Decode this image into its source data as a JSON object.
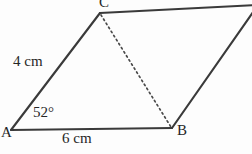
{
  "figure": {
    "kind": "parallelogram-with-diagonal",
    "background_color": "#fdfdfd",
    "stroke_color": "#3a3a3a",
    "text_color": "#262626"
  },
  "vertices": [
    {
      "name": "A",
      "label": "A",
      "x": 11,
      "y": 130,
      "label_x": 1,
      "label_y": 125
    },
    {
      "name": "B",
      "label": "B",
      "x": 172,
      "y": 128,
      "label_x": 177,
      "label_y": 123
    },
    {
      "name": "C",
      "label": "C",
      "x": 100,
      "y": 13,
      "label_x": 99,
      "label_y": -5
    },
    {
      "name": "D",
      "label": "",
      "x": 256,
      "y": 6,
      "label_x": 0,
      "label_y": 0
    }
  ],
  "edges": [
    {
      "name": "side-AC",
      "from": "A",
      "to": "C",
      "style": "solid"
    },
    {
      "name": "side-AB",
      "from": "A",
      "to": "B",
      "style": "solid"
    },
    {
      "name": "side-CD",
      "from": "C",
      "to": "D",
      "style": "solid"
    },
    {
      "name": "side-BD",
      "from": "B",
      "to": "D",
      "style": "solid"
    },
    {
      "name": "diagonal-CB",
      "from": "C",
      "to": "B",
      "style": "dashed"
    }
  ],
  "labels": {
    "side_ac": "4 cm",
    "side_ab": "6 cm",
    "angle_a": "52°",
    "vertex_a": "A",
    "vertex_b": "B",
    "vertex_c": "C"
  },
  "measurements": {
    "ac_length_cm": 4,
    "ab_length_cm": 6,
    "angle_a_degrees": 52
  }
}
